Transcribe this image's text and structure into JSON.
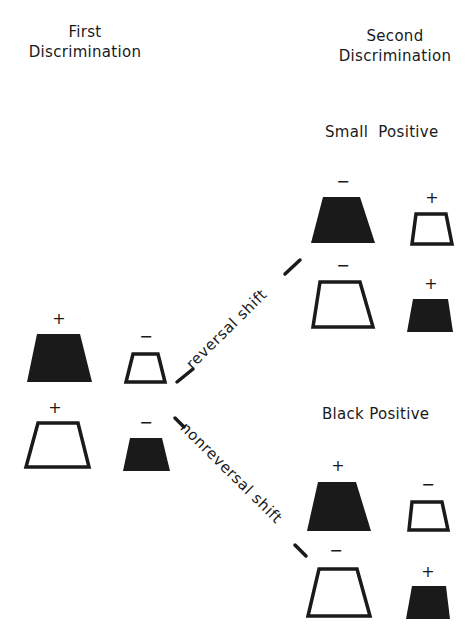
{
  "headings": {
    "first": [
      "First",
      "Discrimination"
    ],
    "second": [
      "Second",
      "Discrimination"
    ]
  },
  "subheadings": {
    "small_positive": "Small  Positive",
    "black_positive": "Black Positive"
  },
  "shift_labels": {
    "reversal": "reversal shift",
    "nonreversal": "nonreversal shift"
  },
  "colors": {
    "ink": "#1a1a1a",
    "background": "#ffffff"
  },
  "first_discrimination": {
    "rows": [
      [
        {
          "size": "large",
          "fill": "black",
          "sign": "+"
        },
        {
          "size": "small",
          "fill": "white",
          "sign": "−"
        }
      ],
      [
        {
          "size": "large",
          "fill": "white",
          "sign": "+"
        },
        {
          "size": "small",
          "fill": "black",
          "sign": "−"
        }
      ]
    ]
  },
  "second_discrimination": {
    "small_positive": {
      "rows": [
        [
          {
            "size": "large",
            "fill": "black",
            "sign": "−"
          },
          {
            "size": "small",
            "fill": "white",
            "sign": "+"
          }
        ],
        [
          {
            "size": "large",
            "fill": "white",
            "sign": "−"
          },
          {
            "size": "small",
            "fill": "black",
            "sign": "+"
          }
        ]
      ]
    },
    "black_positive": {
      "rows": [
        [
          {
            "size": "large",
            "fill": "black",
            "sign": "+"
          },
          {
            "size": "small",
            "fill": "white",
            "sign": "−"
          }
        ],
        [
          {
            "size": "large",
            "fill": "white",
            "sign": "−"
          },
          {
            "size": "small",
            "fill": "black",
            "sign": "+"
          }
        ]
      ]
    }
  }
}
